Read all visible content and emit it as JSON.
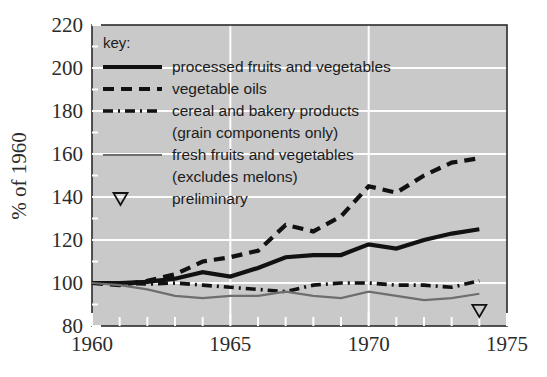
{
  "chart_data": {
    "type": "line",
    "title": "",
    "xlabel": "",
    "ylabel": "% of 1960",
    "xlim": [
      1960,
      1975
    ],
    "ylim": [
      80,
      220
    ],
    "ytick_values": [
      80,
      100,
      120,
      140,
      160,
      180,
      200,
      220
    ],
    "ytick_labels": [
      "80",
      "100",
      "120",
      "140",
      "160",
      "180",
      "200",
      "220"
    ],
    "xtick_values": [
      1960,
      1965,
      1970,
      1975
    ],
    "xtick_labels": [
      "1960",
      "1965",
      "1970",
      "1975"
    ],
    "minor_xticks_every": 1,
    "grid": "white gridlines on grey plot background",
    "plot_background": "#c9c9c9",
    "legend_position": "upper-left inside plot",
    "legend_title": "key:",
    "x": [
      1960,
      1961,
      1962,
      1963,
      1964,
      1965,
      1966,
      1967,
      1968,
      1969,
      1970,
      1971,
      1972,
      1973,
      1974
    ],
    "series": [
      {
        "name": "processed fruits and vegetables",
        "style": "solid",
        "color": "#111111",
        "values": [
          100,
          100,
          100.5,
          102,
          105,
          103,
          107,
          112,
          113,
          113,
          118,
          116,
          120,
          123,
          125
        ]
      },
      {
        "name": "vegetable oils",
        "style": "dashed",
        "color": "#111111",
        "values": [
          100,
          99,
          101,
          104,
          110,
          112,
          115,
          127,
          124,
          131,
          145,
          142,
          150,
          156,
          158
        ]
      },
      {
        "name": "cereal and bakery products (grain components only)",
        "style": "dash-dot",
        "color": "#111111",
        "values": [
          100,
          100,
          99.5,
          100,
          99,
          98,
          97,
          96,
          99,
          100,
          100,
          99,
          99,
          98,
          101
        ]
      },
      {
        "name": "fresh fruits and vegetables (excludes melons)",
        "style": "solid-thin",
        "color": "#6e6e6e",
        "values": [
          100,
          99,
          97,
          94,
          93,
          94,
          94,
          96,
          94,
          93,
          96,
          94,
          92,
          93,
          95
        ]
      }
    ],
    "annotations": [
      {
        "label": "preliminary",
        "marker": "open-triangle-down",
        "x": 1974,
        "y": 87
      }
    ],
    "legend_entries": [
      {
        "label": "processed fruits and vegetables",
        "style": "solid",
        "sub": ""
      },
      {
        "label": "vegetable oils",
        "style": "dashed",
        "sub": ""
      },
      {
        "label": "cereal and bakery products",
        "style": "dash-dot",
        "sub": "(grain components only)"
      },
      {
        "label": "fresh fruits and vegetables",
        "style": "solid-thin",
        "sub": "(excludes melons)"
      },
      {
        "label": "preliminary",
        "style": "marker-triangle",
        "sub": ""
      }
    ]
  }
}
